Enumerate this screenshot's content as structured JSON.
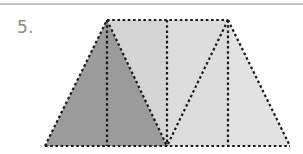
{
  "page": {
    "background_color": "#ffffff",
    "top_rule_color": "#a8a8a8"
  },
  "problem": {
    "number_label": "5.",
    "number_color": "#8a8a8a"
  },
  "figure": {
    "name": "partitioned-trapezoid",
    "outline_style": "dotted",
    "outline_color": "#1a1a1a",
    "vertices": {
      "bottom_left": [
        45,
        146
      ],
      "top_left": [
        107,
        20
      ],
      "top_right": [
        228,
        20
      ],
      "bottom_right": [
        290,
        146
      ],
      "bottom_center": [
        167,
        146
      ]
    },
    "colors": {
      "region_dark": "#9b9b9b",
      "region_mid": "#d4d4d4",
      "region_light": "#dcdcdc",
      "region_lightest": "#e2e2e2"
    },
    "regions": [
      {
        "name": "left-outer-triangle",
        "points": "45,146 107,20 107,146",
        "fill": "#9b9b9b"
      },
      {
        "name": "left-inner-triangle",
        "points": "107,20 167,146 107,146",
        "fill": "#9b9b9b"
      },
      {
        "name": "upper-left-triangle",
        "points": "107,20 167,20 167,146",
        "fill": "#d4d4d4"
      },
      {
        "name": "center-right-triangle",
        "points": "167,20 228,20 167,146",
        "fill": "#dcdcdc"
      },
      {
        "name": "right-inner-triangle",
        "points": "167,146 228,20 228,146",
        "fill": "#dcdcdc"
      },
      {
        "name": "right-outer-triangle",
        "points": "228,20 290,146 228,146",
        "fill": "#e2e2e2"
      }
    ],
    "dotted_lines": [
      {
        "name": "top-edge",
        "from": [
          107,
          20
        ],
        "to": [
          228,
          20
        ]
      },
      {
        "name": "bottom-edge",
        "from": [
          45,
          146
        ],
        "to": [
          290,
          146
        ]
      },
      {
        "name": "left-slant-edge",
        "from": [
          45,
          146
        ],
        "to": [
          107,
          20
        ]
      },
      {
        "name": "right-slant-edge",
        "from": [
          228,
          20
        ],
        "to": [
          290,
          146
        ]
      },
      {
        "name": "left-vertical-altitude",
        "from": [
          107,
          20
        ],
        "to": [
          107,
          146
        ]
      },
      {
        "name": "center-vertical-line",
        "from": [
          167,
          20
        ],
        "to": [
          167,
          146
        ]
      },
      {
        "name": "right-vertical-altitude",
        "from": [
          228,
          20
        ],
        "to": [
          228,
          146
        ]
      },
      {
        "name": "left-apex-diagonal",
        "from": [
          107,
          20
        ],
        "to": [
          167,
          146
        ]
      },
      {
        "name": "right-apex-diagonal",
        "from": [
          228,
          20
        ],
        "to": [
          167,
          146
        ]
      }
    ]
  }
}
